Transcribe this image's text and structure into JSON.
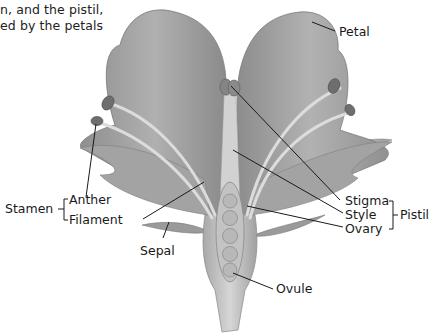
{
  "caption": {
    "line1": "n, and the pistil,",
    "line2": "ed by the petals"
  },
  "labels": {
    "petal": "Petal",
    "stamen": "Stamen",
    "anther": "Anther",
    "filament": "Filament",
    "sepal": "Sepal",
    "stigma": "Stigma",
    "style": "Style",
    "ovary": "Ovary",
    "pistil": "Pistil",
    "ovule": "Ovule"
  },
  "groups": {
    "stamen": [
      "Anther",
      "Filament"
    ],
    "pistil": [
      "Stigma",
      "Style",
      "Ovary"
    ]
  },
  "colors": {
    "petal": "#9a9a9a",
    "petal_light": "#bdbdbd",
    "anther": "#6e6e6e",
    "filament": "#d9d9d9",
    "ovary": "#c8c8c8",
    "ovule": "#b5b5b5",
    "line": "#1a1a1a"
  }
}
